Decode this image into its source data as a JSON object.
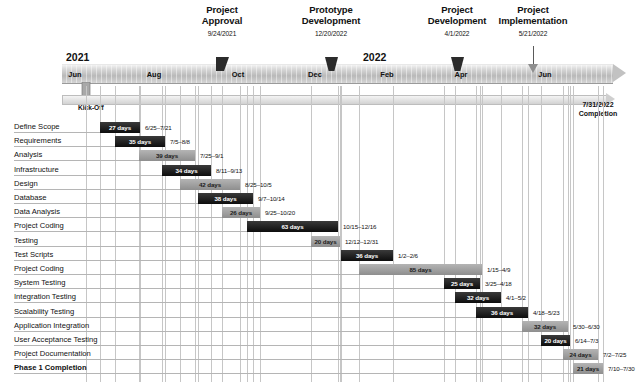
{
  "chart_data": {
    "type": "bar",
    "chart_kind": "gantt",
    "axis_start": "2021-06-01",
    "axis_end": "2022-07-31",
    "xlabel": "",
    "ylabel": "",
    "grid": true,
    "year_labels": [
      {
        "text": "2021",
        "x_px": 66,
        "y_px": 52
      },
      {
        "text": "2022",
        "x_px": 363,
        "y_px": 52
      }
    ],
    "month_ticks": [
      {
        "label": "Jun",
        "x_px": 75
      },
      {
        "label": "Aug",
        "x_px": 154
      },
      {
        "label": "Oct",
        "x_px": 238
      },
      {
        "label": "Dec",
        "x_px": 315
      },
      {
        "label": "Feb",
        "x_px": 387
      },
      {
        "label": "Apr",
        "x_px": 461
      },
      {
        "label": "Jun",
        "x_px": 545
      }
    ],
    "start_marker": {
      "label": "Kick-Off"
    },
    "end_marker": {
      "date": "7/31/2022",
      "label": "Completion"
    },
    "milestones": [
      {
        "title_line1": "Project",
        "title_line2": "Approval",
        "date": "9/24/2021",
        "x_px": 222,
        "marker": "tri"
      },
      {
        "title_line1": "Prototype",
        "title_line2": "Development",
        "date": "12/20/2022",
        "x_px": 331,
        "marker": "trap"
      },
      {
        "title_line1": "Project",
        "title_line2": "Development",
        "date": "4/1/2022",
        "x_px": 457,
        "marker": "trap"
      },
      {
        "title_line1": "Project",
        "title_line2": "Implementation",
        "date": "5/21/2022",
        "x_px": 533,
        "marker": "pin"
      }
    ],
    "tasks": [
      {
        "name": "Define Scope",
        "duration": "27 days",
        "dates": "6/25–7/21",
        "bar_x": 100,
        "bar_w": 40,
        "color": "dark",
        "bold": false
      },
      {
        "name": "Requirements",
        "duration": "35 days",
        "dates": "7/5–8/8",
        "bar_x": 115,
        "bar_w": 50,
        "color": "dark",
        "bold": false
      },
      {
        "name": "Analysis",
        "duration": "39 days",
        "dates": "7/25–9/1",
        "bar_x": 139,
        "bar_w": 56,
        "color": "gray",
        "bold": false
      },
      {
        "name": "Infrastructure",
        "duration": "34 days",
        "dates": "8/11–9/13",
        "bar_x": 162,
        "bar_w": 49,
        "color": "dark",
        "bold": false
      },
      {
        "name": "Design",
        "duration": "42 days",
        "dates": "8/25–10/5",
        "bar_x": 180,
        "bar_w": 60,
        "color": "gray",
        "bold": false
      },
      {
        "name": "Database",
        "duration": "38 days",
        "dates": "9/7–10/14",
        "bar_x": 198,
        "bar_w": 55,
        "color": "dark",
        "bold": false
      },
      {
        "name": "Data Analysis",
        "duration": "26 days",
        "dates": "9/25–10/20",
        "bar_x": 222,
        "bar_w": 38,
        "color": "gray",
        "bold": false
      },
      {
        "name": "Project Coding",
        "duration": "63 days",
        "dates": "10/15–12/16",
        "bar_x": 247,
        "bar_w": 91,
        "color": "dark",
        "bold": false
      },
      {
        "name": "Testing",
        "duration": "20 days",
        "dates": "12/12–12/31",
        "bar_x": 311,
        "bar_w": 29,
        "color": "gray",
        "bold": false
      },
      {
        "name": "Test Scripts",
        "duration": "36 days",
        "dates": "1/2–2/6",
        "bar_x": 341,
        "bar_w": 52,
        "color": "dark",
        "bold": false
      },
      {
        "name": "Project Coding",
        "duration": "85 days",
        "dates": "1/15–4/9",
        "bar_x": 359,
        "bar_w": 123,
        "color": "gray",
        "bold": false
      },
      {
        "name": "System Testing",
        "duration": "25 days",
        "dates": "3/25–4/18",
        "bar_x": 444,
        "bar_w": 36,
        "color": "dark",
        "bold": false
      },
      {
        "name": "Integration Testing",
        "duration": "32 days",
        "dates": "4/1–5/2",
        "bar_x": 455,
        "bar_w": 46,
        "color": "dark",
        "bold": false
      },
      {
        "name": "Scalability Testing",
        "duration": "36 days",
        "dates": "4/18–5/23",
        "bar_x": 476,
        "bar_w": 52,
        "color": "dark",
        "bold": false
      },
      {
        "name": "Application Integration",
        "duration": "32 days",
        "dates": "5/30–6/30",
        "bar_x": 522,
        "bar_w": 46,
        "color": "gray",
        "bold": false
      },
      {
        "name": "User Acceptance Testing",
        "duration": "20 days",
        "dates": "6/14–7/3",
        "bar_x": 541,
        "bar_w": 29,
        "color": "dark",
        "bold": false
      },
      {
        "name": "Project Documentation",
        "duration": "24 days",
        "dates": "7/2–7/25",
        "bar_x": 563,
        "bar_w": 35,
        "color": "gray",
        "bold": false
      },
      {
        "name": "Phase 1 Completion",
        "duration": "21 days",
        "dates": "7/10–7/30",
        "bar_x": 573,
        "bar_w": 30,
        "color": "gray",
        "bold": true
      }
    ],
    "colors": {
      "bar_dark": "#151515",
      "bar_gray": "#9e9e9e",
      "ribbon": "#c9c9c9",
      "grid": "#c6c6c6",
      "text": "#111111"
    }
  }
}
